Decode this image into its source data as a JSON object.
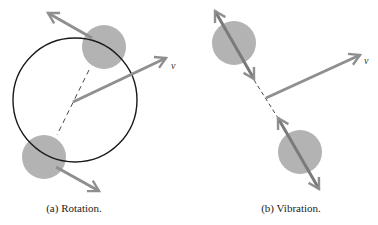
{
  "colors": {
    "ball": "#b3b3b3",
    "arrow": "#8f8f8f",
    "circle": "#1a1a1a",
    "dash": "#333333",
    "text": "#222222"
  },
  "panels": [
    {
      "id": "a",
      "caption": "(a) Rotation.",
      "velocity_label": "v",
      "elements": [
        "orbit-circle",
        "ball-top",
        "ball-bottom",
        "tangential-arrow-top",
        "tangential-arrow-bottom",
        "axis-dashed-line",
        "velocity-arrow"
      ]
    },
    {
      "id": "b",
      "caption": "(b) Vibration.",
      "velocity_label": "v",
      "elements": [
        "ball-top",
        "ball-bottom",
        "double-arrow-top",
        "double-arrow-bottom",
        "axis-dashed-line",
        "velocity-arrow"
      ]
    }
  ]
}
